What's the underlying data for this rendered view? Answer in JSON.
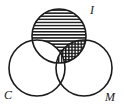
{
  "figure": {
    "kind": "venn-diagram",
    "set_count": 3,
    "background_color": "#ffffff",
    "stroke_color": "#1a1a1a",
    "width": 124,
    "height": 110
  },
  "labels": {
    "top": "I",
    "bottom_left": "C",
    "bottom_right": "M"
  },
  "sets": [
    {
      "id": "I",
      "label": "I",
      "label_position": "upper-right",
      "cx": 59,
      "cy": 36,
      "r": 27,
      "label_x": 92,
      "label_y": 14
    },
    {
      "id": "C",
      "label": "C",
      "label_position": "lower-left",
      "cx": 37,
      "cy": 68,
      "r": 28,
      "label_x": 7,
      "label_y": 99
    },
    {
      "id": "M",
      "label": "M",
      "label_position": "lower-right",
      "cx": 84,
      "cy": 68,
      "r": 28,
      "label_x": 108,
      "label_y": 101
    }
  ],
  "shaded_regions": [
    {
      "id": "I-only",
      "description": "I excluding C and M",
      "pattern": "horizontal-lines",
      "pattern_color": "#1a1a1a"
    },
    {
      "id": "I-and-M",
      "description": "I intersect M excluding C",
      "pattern": "cross-hatch",
      "pattern_color": "#1a1a1a"
    },
    {
      "id": "I-and-C-and-M",
      "description": "I intersect C intersect M",
      "pattern": "vertical-lines",
      "pattern_color": "#1a1a1a"
    },
    {
      "id": "I-and-C",
      "description": "I intersect C excluding M",
      "pattern": "none",
      "pattern_color": "#ffffff"
    }
  ]
}
